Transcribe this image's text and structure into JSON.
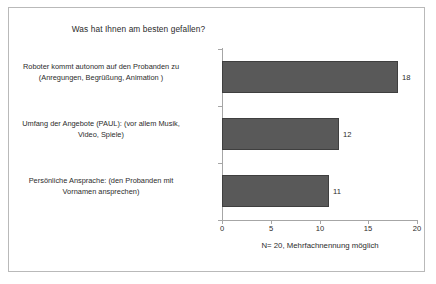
{
  "chart_data": {
    "type": "bar",
    "orientation": "horizontal",
    "title": "Was hat Ihnen am besten gefallen?",
    "categories": [
      "Roboter kommt autonom auf den Probanden zu (Anregungen, Begrüßung, Animation )",
      "Umfang der Angebote (PAUL): (vor allem Musik, Video, Spiele)",
      "Persönliche Ansprache: (den Probanden mit Vornamen ansprechen)"
    ],
    "category_lines": [
      [
        "Roboter kommt autonom auf den Probanden zu",
        "(Anregungen, Begrüßung, Animation )"
      ],
      [
        "Umfang der Angebote (PAUL): (vor allem Musik,",
        "Video, Spiele)"
      ],
      [
        "Persönliche Ansprache: (den Probanden mit",
        "Vornamen ansprechen)"
      ]
    ],
    "values": [
      18,
      12,
      11
    ],
    "value_labels": [
      "18",
      "12",
      "11"
    ],
    "xlabel": "N= 20, Mehrfachnennung möglich",
    "ylabel": "",
    "xlim": [
      0,
      20
    ],
    "xticks": [
      0,
      5,
      10,
      15,
      20
    ],
    "xtick_labels": [
      "0",
      "5",
      "10",
      "15",
      "20"
    ],
    "grid": false,
    "legend": false,
    "bar_color": "#595959",
    "bar_border_color": "#3f3f3f",
    "axis_color": "#a6a6a6",
    "text_color": "#2b2b2b",
    "background": "#ffffff",
    "frame_border_color": "#b9b9b9"
  },
  "caption": {
    "text": "N= 20, Mehrfachnennung möglich"
  }
}
